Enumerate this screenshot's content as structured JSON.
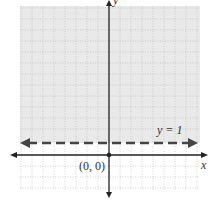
{
  "diagram": {
    "type": "coordinate-plane-inequality",
    "inequality": "y > 1",
    "boundary_line": {
      "equation_label": "y = 1",
      "style": "dashed",
      "y_value": 1
    },
    "shaded_region": "above boundary line",
    "axes": {
      "x_label": "x",
      "y_label": "y"
    },
    "origin_label": "(0, 0)",
    "grid": {
      "spacing_units": 1,
      "x_range": [
        -8,
        8
      ],
      "y_range": [
        -4,
        14
      ]
    },
    "colors": {
      "shade": "#e9e9e9",
      "grid": "#b8b8b8",
      "axis": "#222222",
      "dashed_line": "#444444",
      "background": "#ffffff"
    }
  }
}
